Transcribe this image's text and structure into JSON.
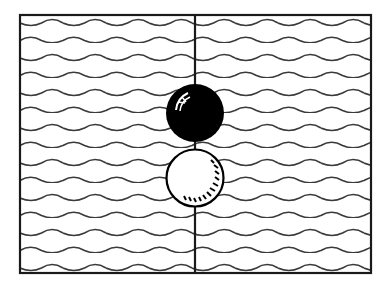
{
  "puzzle": {
    "description": "Go-style diagram: a black stone and a white stone stacked on a vertical line over a wave-patterned field",
    "frame": {
      "x": 20,
      "y": 15,
      "width": 351,
      "height": 258,
      "stroke": "#1a1a1a"
    },
    "divider": {
      "x": 195,
      "stroke": "#1a1a1a"
    },
    "waves": {
      "rows": 15,
      "first_y": 23,
      "row_spacing": 17.5,
      "period": 43,
      "stroke": "#3a3a3a"
    },
    "stones": [
      {
        "color": "black",
        "cx": 195,
        "cy": 113,
        "r": 29,
        "fill": "#000000"
      },
      {
        "color": "white",
        "cx": 195,
        "cy": 178,
        "r": 29,
        "fill": "#ffffff"
      }
    ]
  }
}
